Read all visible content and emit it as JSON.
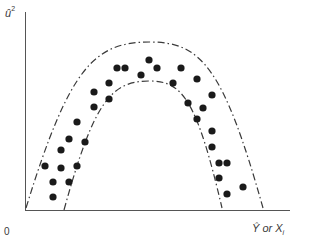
{
  "figure": {
    "y_axis_label": "û",
    "y_axis_label_exponent": "2",
    "origin_label": "0",
    "x_axis_label_main": "Ŷ or X",
    "x_axis_label_sub": "i",
    "curve_style": "dash-dot",
    "point_color": "#1a1a1a",
    "line_color": "#3a3a3a"
  },
  "chart_data": {
    "type": "scatter",
    "title": "",
    "xlabel": "Ŷ or X_i",
    "ylabel": "û²",
    "grid": false,
    "envelopes": [
      {
        "name": "outer",
        "start": [
          26,
          208
        ],
        "peak": [
          150,
          42
        ],
        "end": [
          263,
          208
        ]
      },
      {
        "name": "inner",
        "start": [
          64,
          210
        ],
        "peak": [
          150,
          81
        ],
        "end": [
          222,
          208
        ]
      }
    ],
    "points_px": [
      [
        45,
        166
      ],
      [
        53,
        182
      ],
      [
        53,
        197
      ],
      [
        61,
        150
      ],
      [
        61,
        168
      ],
      [
        69,
        182
      ],
      [
        69,
        139
      ],
      [
        77,
        122
      ],
      [
        77,
        166
      ],
      [
        85,
        142
      ],
      [
        94,
        92
      ],
      [
        94,
        107
      ],
      [
        109,
        83
      ],
      [
        109,
        99
      ],
      [
        117,
        68
      ],
      [
        125,
        68
      ],
      [
        141,
        75
      ],
      [
        149,
        60
      ],
      [
        157,
        68
      ],
      [
        181,
        68
      ],
      [
        173,
        83
      ],
      [
        197,
        79
      ],
      [
        212,
        95
      ],
      [
        188,
        103
      ],
      [
        203,
        108
      ],
      [
        197,
        119
      ],
      [
        212,
        131
      ],
      [
        212,
        147
      ],
      [
        219,
        163
      ],
      [
        227,
        163
      ],
      [
        219,
        178
      ],
      [
        243,
        187
      ],
      [
        227,
        194
      ]
    ]
  }
}
